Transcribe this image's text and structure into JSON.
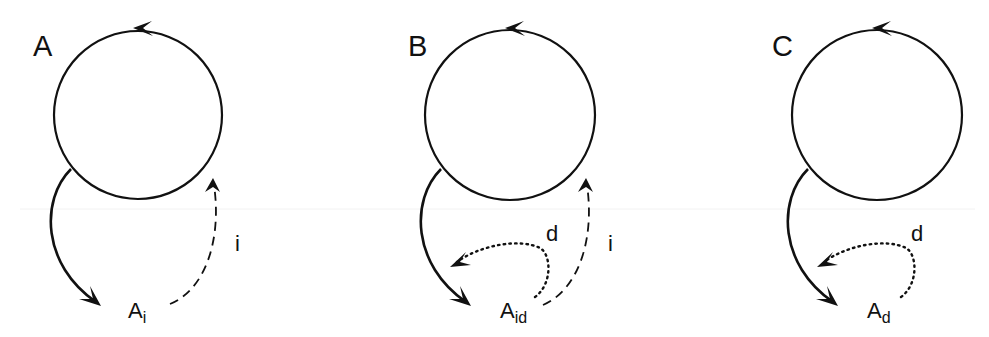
{
  "diagram": {
    "type": "cycle-exit-diagram",
    "colors": {
      "stroke": "#111111",
      "background": "#ffffff"
    },
    "panels": [
      {
        "id": "A",
        "label": "A",
        "node": {
          "main": "A",
          "sub": "i"
        },
        "edges": [
          {
            "kind": "cycle",
            "style": "solid",
            "direction": "counterclockwise"
          },
          {
            "kind": "exit",
            "style": "solid",
            "from": "cycle",
            "to": "node"
          },
          {
            "kind": "return",
            "style": "dashed",
            "label": "i",
            "from": "node",
            "to": "cycle"
          }
        ]
      },
      {
        "id": "B",
        "label": "B",
        "node": {
          "main": "A",
          "sub": "id"
        },
        "edges": [
          {
            "kind": "cycle",
            "style": "solid",
            "direction": "counterclockwise"
          },
          {
            "kind": "exit",
            "style": "solid",
            "from": "cycle",
            "to": "node"
          },
          {
            "kind": "detour",
            "style": "dotted",
            "label": "d",
            "from": "node",
            "to": "exit-path"
          },
          {
            "kind": "return",
            "style": "dashed",
            "label": "i",
            "from": "node",
            "to": "cycle"
          }
        ]
      },
      {
        "id": "C",
        "label": "C",
        "node": {
          "main": "A",
          "sub": "d"
        },
        "edges": [
          {
            "kind": "cycle",
            "style": "solid",
            "direction": "counterclockwise"
          },
          {
            "kind": "exit",
            "style": "solid",
            "from": "cycle",
            "to": "node"
          },
          {
            "kind": "detour",
            "style": "dotted",
            "label": "d",
            "from": "node",
            "to": "exit-path"
          }
        ]
      }
    ]
  }
}
